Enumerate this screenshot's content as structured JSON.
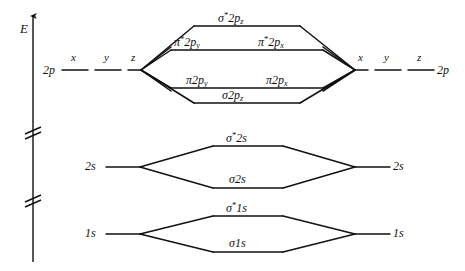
{
  "figure": {
    "type": "molecular-orbital-energy-diagram",
    "axis": {
      "label": "E",
      "direction": "up",
      "break_marks": 2
    },
    "atomic_left": {
      "p_label": "2p",
      "p_components": [
        "x",
        "y",
        "z"
      ],
      "s2_label": "2s",
      "s1_label": "1s"
    },
    "atomic_right": {
      "p_label": "2p",
      "p_components": [
        "x",
        "y",
        "z"
      ],
      "s2_label": "2s",
      "s1_label": "1s"
    },
    "molecular_orbitals": [
      {
        "name": "sigma-star-2pz",
        "sym": "σ",
        "star": "*",
        "shell": "2p",
        "sub": "z"
      },
      {
        "name": "pi-star-2py",
        "sym": "π",
        "star": "*",
        "shell": "2p",
        "sub": "y"
      },
      {
        "name": "pi-star-2px",
        "sym": "π",
        "star": "*",
        "shell": "2p",
        "sub": "x"
      },
      {
        "name": "pi-2py",
        "sym": "π",
        "star": "",
        "shell": "2p",
        "sub": "y"
      },
      {
        "name": "pi-2px",
        "sym": "π",
        "star": "",
        "shell": "2p",
        "sub": "x"
      },
      {
        "name": "sigma-2pz",
        "sym": "σ",
        "star": "",
        "shell": "2p",
        "sub": "z"
      },
      {
        "name": "sigma-star-2s",
        "sym": "σ",
        "star": "*",
        "shell": "2s",
        "sub": ""
      },
      {
        "name": "sigma-2s",
        "sym": "σ",
        "star": "",
        "shell": "2s",
        "sub": ""
      },
      {
        "name": "sigma-star-1s",
        "sym": "σ",
        "star": "*",
        "shell": "1s",
        "sub": ""
      },
      {
        "name": "sigma-1s",
        "sym": "σ",
        "star": "",
        "shell": "1s",
        "sub": ""
      }
    ],
    "labels": {
      "E": "E",
      "p_left": "2p",
      "p_right": "2p",
      "s2_left": "2s",
      "s2_right": "2s",
      "s1_left": "1s",
      "s1_right": "1s",
      "x1": "x",
      "y1": "y",
      "z1": "z",
      "x2": "x",
      "y2": "y",
      "z2": "z",
      "sigma": "σ",
      "pi": "π",
      "star": "*",
      "shell_2p": "2p",
      "shell_2s": "2s",
      "shell_1s": "1s",
      "sub_x": "x",
      "sub_y": "y",
      "sub_z": "z"
    },
    "colors": {
      "ink": "#111111",
      "background": "#ffffff"
    }
  }
}
